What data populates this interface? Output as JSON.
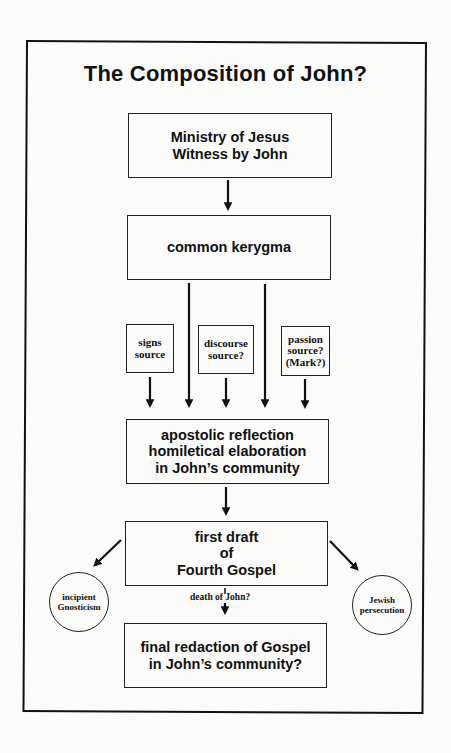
{
  "title": "The Composition of John?",
  "colors": {
    "ink": "#111111",
    "background": "#fbfbfa"
  },
  "nodes": {
    "ministry": {
      "label": "Ministry of Jesus\nWitness by John"
    },
    "kerygma": {
      "label": "common kerygma"
    },
    "signs_source": {
      "label": "signs\nsource"
    },
    "discourse_source": {
      "label": "discourse\nsource?"
    },
    "passion_source": {
      "label": "passion\nsource?\n(Mark?)"
    },
    "apostolic": {
      "label": "apostolic reflection\nhomiletical elaboration\nin John’s community"
    },
    "first_draft": {
      "label": "first draft\nof\nFourth Gospel"
    },
    "gnosticism": {
      "label": "incipient\nGnosticism"
    },
    "persecution": {
      "label": "Jewish\npersecution"
    },
    "final": {
      "label": "final redaction of Gospel\nin John’s community?"
    }
  },
  "edge_labels": {
    "death": "death of John?"
  },
  "edges": [
    [
      "ministry",
      "kerygma"
    ],
    [
      "kerygma",
      "apostolic"
    ],
    [
      "kerygma",
      "apostolic"
    ],
    [
      "signs_source",
      "apostolic"
    ],
    [
      "discourse_source",
      "apostolic"
    ],
    [
      "passion_source",
      "apostolic"
    ],
    [
      "apostolic",
      "first_draft"
    ],
    [
      "first_draft",
      "gnosticism"
    ],
    [
      "first_draft",
      "persecution"
    ],
    [
      "first_draft",
      "final"
    ]
  ]
}
